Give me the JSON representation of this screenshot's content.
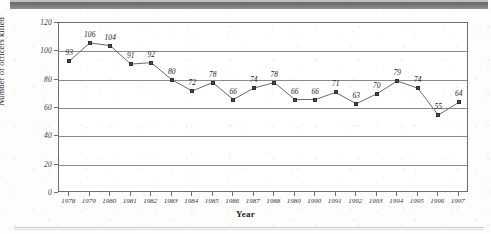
{
  "chart_data": {
    "type": "line",
    "title": "",
    "xlabel": "Year",
    "ylabel": "Number of officers killed",
    "ylim": [
      0,
      120
    ],
    "ytick_step": 20,
    "yticks": [
      0,
      20,
      40,
      60,
      80,
      100,
      120
    ],
    "grid": true,
    "legend": "none",
    "marker": "square",
    "data_labels": true,
    "categories": [
      "1978",
      "1979",
      "1980",
      "1981",
      "1982",
      "1983",
      "1984",
      "1985",
      "1986",
      "1987",
      "1988",
      "1989",
      "1990",
      "1991",
      "1992",
      "1993",
      "1994",
      "1995",
      "1996",
      "1997"
    ],
    "values": [
      93,
      106,
      104,
      91,
      92,
      80,
      72,
      78,
      66,
      74,
      78,
      66,
      66,
      71,
      63,
      70,
      79,
      74,
      55,
      64
    ],
    "series": [
      {
        "name": "Officers killed",
        "values": [
          93,
          106,
          104,
          91,
          92,
          80,
          72,
          78,
          66,
          74,
          78,
          66,
          66,
          71,
          63,
          70,
          79,
          74,
          55,
          64
        ]
      }
    ]
  },
  "colors": {
    "line": "#6b6b6b",
    "marker": "#4a4a4a",
    "frame": "#6e6e6e",
    "grid": "#8a8a8a",
    "text": "#1a1a1a",
    "page": "#ffffff",
    "scan_band": "#5d5d5d"
  },
  "page": {
    "background_note": ""
  }
}
